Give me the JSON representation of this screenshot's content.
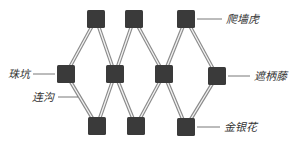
{
  "diagram": {
    "type": "planting-layout",
    "colors": {
      "node": "#3a3a3a",
      "connector_outer": "#8a8a8a",
      "connector_inner": "#f4f4f4",
      "leader_line": "#555555",
      "label": "#333333",
      "background": "#ffffff"
    },
    "node_size": 18,
    "nodes": [
      {
        "id": "t1",
        "row": "top",
        "x": 96,
        "y": 19
      },
      {
        "id": "t2",
        "row": "top",
        "x": 134,
        "y": 19
      },
      {
        "id": "t3",
        "row": "top",
        "x": 186,
        "y": 19
      },
      {
        "id": "m1",
        "row": "middle",
        "x": 66,
        "y": 74
      },
      {
        "id": "m2",
        "row": "middle",
        "x": 115,
        "y": 74
      },
      {
        "id": "m3",
        "row": "middle",
        "x": 164,
        "y": 74
      },
      {
        "id": "m4",
        "row": "middle",
        "x": 217,
        "y": 76
      },
      {
        "id": "b1",
        "row": "bottom",
        "x": 97,
        "y": 126
      },
      {
        "id": "b2",
        "row": "bottom",
        "x": 136,
        "y": 126
      },
      {
        "id": "b3",
        "row": "bottom",
        "x": 186,
        "y": 127
      }
    ],
    "edges": [
      [
        "m1",
        "t1"
      ],
      [
        "t1",
        "m2"
      ],
      [
        "m2",
        "t2"
      ],
      [
        "t2",
        "m3"
      ],
      [
        "m3",
        "t3"
      ],
      [
        "t3",
        "m4"
      ],
      [
        "m1",
        "b1"
      ],
      [
        "b1",
        "m2"
      ],
      [
        "m2",
        "b2"
      ],
      [
        "b2",
        "m3"
      ],
      [
        "m3",
        "b3"
      ],
      [
        "b3",
        "m4"
      ]
    ],
    "labels": [
      {
        "id": "top-right",
        "text": "爬墙虎",
        "meaning": "Boston ivy",
        "line": [
          197,
          19,
          222,
          19
        ],
        "x": 226,
        "y": 23
      },
      {
        "id": "middle-right",
        "text": "遮柄藤",
        "meaning": "covering vine",
        "line": [
          228,
          76,
          250,
          76
        ],
        "x": 254,
        "y": 80
      },
      {
        "id": "bottom-right",
        "text": "金银花",
        "meaning": "honeysuckle",
        "line": [
          197,
          127,
          220,
          127
        ],
        "x": 224,
        "y": 131
      },
      {
        "id": "middle-left",
        "text": "珠坑",
        "meaning": "planting pit",
        "line": [
          33,
          74,
          55,
          74
        ],
        "x": 8,
        "y": 78
      },
      {
        "id": "lower-left",
        "text": "连沟",
        "meaning": "connecting ditch",
        "line": [
          58,
          97,
          78,
          97
        ],
        "x": 32,
        "y": 101
      }
    ]
  }
}
